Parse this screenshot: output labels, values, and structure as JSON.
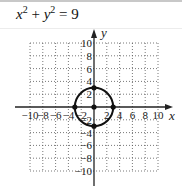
{
  "header": {
    "equation_x": "x",
    "equation_x_exp": "2",
    "equation_plus": " + ",
    "equation_y": "y",
    "equation_y_exp": "2",
    "equation_rhs": " = 9"
  },
  "colors": {
    "axis": "#222222",
    "grid": "#555555",
    "curve": "#111111"
  },
  "chart_data": {
    "type": "scatter",
    "xlabel": "x",
    "ylabel": "y",
    "xlim": [
      -10,
      10
    ],
    "ylim": [
      -10,
      10
    ],
    "grid": true,
    "grid_step": 2,
    "x_tick_labels": [
      "-10",
      "-8",
      "-6",
      "-4",
      "-2",
      "2",
      "4",
      "6",
      "8",
      "10"
    ],
    "y_tick_labels": [
      "10",
      "8",
      "6",
      "4",
      "2",
      "-2",
      "-4",
      "-6",
      "-8",
      "-10"
    ],
    "curve": {
      "shape": "circle",
      "center": [
        0,
        0
      ],
      "radius": 3
    },
    "points": [
      {
        "x": 0,
        "y": 0,
        "label": "center"
      },
      {
        "x": 3,
        "y": 0
      },
      {
        "x": -3,
        "y": 0
      },
      {
        "x": 0,
        "y": 3
      },
      {
        "x": 0,
        "y": -3
      }
    ]
  }
}
